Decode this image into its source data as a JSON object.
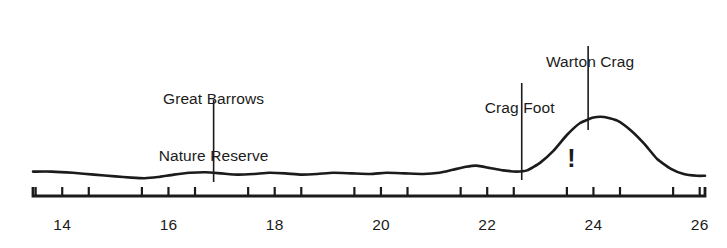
{
  "figure": {
    "title": "",
    "background_color": "#ffffff",
    "line_color": "#1b1b1b",
    "text_color": "#1b1b1b"
  },
  "annotations": [
    {
      "name": "great-barrows-nature-reserve",
      "line1": "Great Barrows",
      "line2": "Nature Reserve",
      "x_value": 16.85
    },
    {
      "name": "crag-foot",
      "line1": "Crag Foot",
      "line2": "",
      "x_value": 22.65
    },
    {
      "name": "warton-crag",
      "line1": "Warton Crag",
      "line2": "",
      "x_value": 23.9
    }
  ],
  "marker": {
    "symbol": "!",
    "x_value": 23.6
  },
  "axis": {
    "tick_labels": [
      "14",
      "16",
      "18",
      "20",
      "22",
      "24",
      "26"
    ],
    "tick_values": [
      14,
      16,
      18,
      20,
      22,
      24,
      26
    ],
    "minor_tick_values": [
      13.5,
      14.5,
      15.5,
      16.5,
      17.5,
      18.5,
      19.5,
      20.5,
      21.5,
      22.5,
      23.5,
      24.5,
      25.5
    ],
    "range": [
      13.45,
      26.1
    ]
  },
  "chart_data": {
    "type": "line",
    "title": "",
    "xlabel": "",
    "ylabel": "",
    "xlim": [
      13.45,
      26.1
    ],
    "ylim": [
      0,
      1
    ],
    "grid": false,
    "legend": "none",
    "series": [
      {
        "name": "profile",
        "x": [
          13.45,
          13.8,
          14.2,
          14.6,
          15.0,
          15.3,
          15.55,
          15.8,
          16.1,
          16.4,
          16.7,
          17.0,
          17.3,
          17.6,
          17.9,
          18.2,
          18.5,
          18.8,
          19.1,
          19.45,
          19.8,
          20.1,
          20.45,
          20.8,
          21.1,
          21.35,
          21.6,
          21.8,
          22.05,
          22.3,
          22.55,
          22.75,
          23.0,
          23.25,
          23.5,
          23.75,
          24.0,
          24.2,
          24.45,
          24.7,
          24.95,
          25.2,
          25.45,
          25.7,
          25.95,
          26.1
        ],
        "y": [
          0.095,
          0.095,
          0.085,
          0.07,
          0.055,
          0.045,
          0.04,
          0.05,
          0.07,
          0.085,
          0.09,
          0.08,
          0.07,
          0.075,
          0.085,
          0.08,
          0.07,
          0.075,
          0.085,
          0.08,
          0.075,
          0.085,
          0.08,
          0.075,
          0.085,
          0.11,
          0.135,
          0.145,
          0.125,
          0.105,
          0.095,
          0.105,
          0.17,
          0.27,
          0.4,
          0.5,
          0.545,
          0.55,
          0.52,
          0.44,
          0.33,
          0.2,
          0.12,
          0.075,
          0.06,
          0.06
        ]
      }
    ]
  }
}
